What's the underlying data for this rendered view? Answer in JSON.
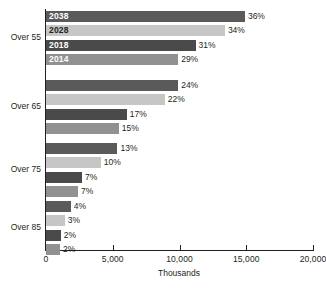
{
  "chart_data": {
    "type": "bar",
    "orientation": "horizontal",
    "title": "",
    "xlabel": "Thousands",
    "ylabel": "",
    "xlim": [
      0,
      20000
    ],
    "xticks": [
      0,
      5000,
      10000,
      15000,
      20000
    ],
    "xtick_labels": [
      "0",
      "5,000",
      "10,000",
      "15,000",
      "20,000"
    ],
    "grid": false,
    "legend_position": "inline-first-group",
    "categories": [
      "Over 55",
      "Over 65",
      "Over 75",
      "Over 85"
    ],
    "series": [
      {
        "name": "2038",
        "color": "#5a5a5a",
        "values": [
          14900,
          9900,
          5350,
          1850
        ],
        "data_labels": [
          "36%",
          "24%",
          "13%",
          "4%"
        ]
      },
      {
        "name": "2028",
        "color": "#c6c6c6",
        "values": [
          13400,
          8900,
          4100,
          1400
        ],
        "data_labels": [
          "34%",
          "22%",
          "10%",
          "3%"
        ]
      },
      {
        "name": "2018",
        "color": "#4a4a4a",
        "values": [
          11200,
          6050,
          2700,
          1100
        ],
        "data_labels": [
          "31%",
          "17%",
          "7%",
          "2%"
        ]
      },
      {
        "name": "2014",
        "color": "#919191",
        "values": [
          9900,
          5450,
          2400,
          1050
        ],
        "data_labels": [
          "29%",
          "15%",
          "7%",
          "2%"
        ]
      }
    ]
  }
}
